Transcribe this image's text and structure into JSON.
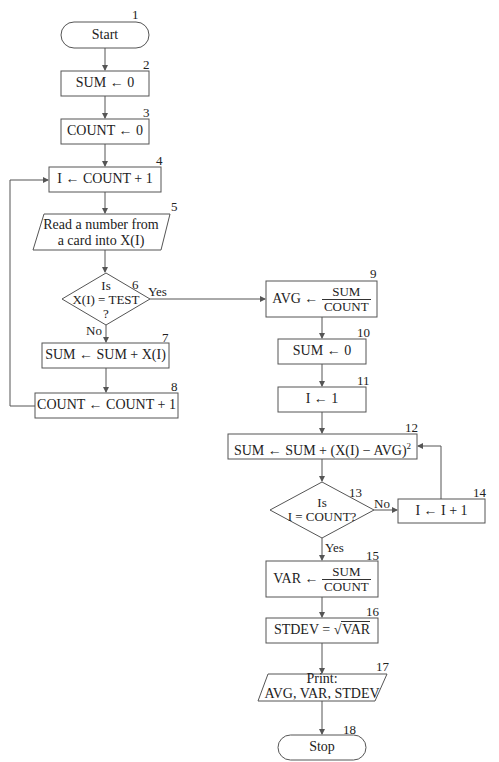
{
  "diagram": {
    "type": "flowchart",
    "nodes": [
      {
        "id": 1,
        "number": "1",
        "shape": "terminal",
        "text": "Start"
      },
      {
        "id": 2,
        "number": "2",
        "shape": "process",
        "text": "SUM ← 0"
      },
      {
        "id": 3,
        "number": "3",
        "shape": "process",
        "text": "COUNT ← 0"
      },
      {
        "id": 4,
        "number": "4",
        "shape": "process",
        "text": "I ← COUNT + 1"
      },
      {
        "id": 5,
        "number": "5",
        "shape": "io",
        "line1": "Read a number from",
        "line2": "a card into X(I)"
      },
      {
        "id": 6,
        "number": "6",
        "shape": "decision",
        "line1": "Is",
        "line2": "X(I) = TEST",
        "line3": "?",
        "yes": "Yes",
        "no": "No"
      },
      {
        "id": 7,
        "number": "7",
        "shape": "process",
        "text": "SUM ← SUM + X(I)"
      },
      {
        "id": 8,
        "number": "8",
        "shape": "process",
        "text": "COUNT ← COUNT + 1"
      },
      {
        "id": 9,
        "number": "9",
        "shape": "process",
        "prefix": "AVG ←",
        "numerator": "SUM",
        "denominator": "COUNT"
      },
      {
        "id": 10,
        "number": "10",
        "shape": "process",
        "text": "SUM ← 0"
      },
      {
        "id": 11,
        "number": "11",
        "shape": "process",
        "text": "I ← 1"
      },
      {
        "id": 12,
        "number": "12",
        "shape": "process",
        "text": "SUM ← SUM + (X(I) − AVG)",
        "exponent": "2"
      },
      {
        "id": 13,
        "number": "13",
        "shape": "decision",
        "line1": "Is",
        "line2": "I = COUNT?",
        "yes": "Yes",
        "no": "No"
      },
      {
        "id": 14,
        "number": "14",
        "shape": "process",
        "text": "I ← I + 1"
      },
      {
        "id": 15,
        "number": "15",
        "shape": "process",
        "prefix": "VAR ←",
        "numerator": "SUM",
        "denominator": "COUNT"
      },
      {
        "id": 16,
        "number": "16",
        "shape": "process",
        "prefix": "STDEV = √",
        "radicand": "VAR"
      },
      {
        "id": 17,
        "number": "17",
        "shape": "io",
        "line1": "Print:",
        "line2": "AVG, VAR, STDEV"
      },
      {
        "id": 18,
        "number": "18",
        "shape": "terminal",
        "text": "Stop"
      }
    ],
    "edges": [
      [
        "1",
        "2"
      ],
      [
        "2",
        "3"
      ],
      [
        "3",
        "4"
      ],
      [
        "4",
        "5"
      ],
      [
        "5",
        "6"
      ],
      [
        "6",
        "7",
        "No"
      ],
      [
        "6",
        "9",
        "Yes"
      ],
      [
        "7",
        "8"
      ],
      [
        "8",
        "4",
        "loop"
      ],
      [
        "9",
        "10"
      ],
      [
        "10",
        "11"
      ],
      [
        "11",
        "12"
      ],
      [
        "12",
        "13"
      ],
      [
        "13",
        "14",
        "No"
      ],
      [
        "13",
        "15",
        "Yes"
      ],
      [
        "14",
        "12",
        "loop"
      ],
      [
        "15",
        "16"
      ],
      [
        "16",
        "17"
      ],
      [
        "17",
        "18"
      ]
    ]
  }
}
